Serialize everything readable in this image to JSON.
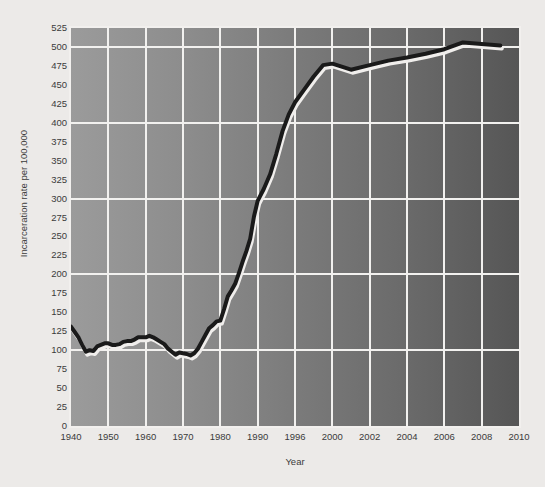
{
  "chart_data": {
    "type": "line",
    "title": "",
    "xlabel": "Year",
    "ylabel": "Incarceration rate per 100,000",
    "xlim": [
      1940,
      2010
    ],
    "ylim": [
      0,
      525
    ],
    "grid": true,
    "legend": null,
    "line_color": "#1a1a1a",
    "plot_bg_left": "#9b9b9b",
    "plot_bg_right": "#565656",
    "gridline_color": "#f2f1ef",
    "figure_bg": "#eceae8",
    "y_ticks": [
      0,
      25,
      50,
      75,
      100,
      125,
      150,
      175,
      200,
      225,
      250,
      275,
      300,
      325,
      350,
      375,
      400,
      425,
      450,
      475,
      500,
      525
    ],
    "y_gridlines": [
      100,
      200,
      300,
      400,
      500
    ],
    "x_ticks": [
      1940,
      1950,
      1960,
      1970,
      1980,
      1990,
      1996,
      2000,
      2002,
      2004,
      2006,
      2008,
      2010
    ],
    "x_tick_labels": [
      "1940",
      "1950",
      "1960",
      "1970",
      "1980",
      "1990",
      "1996",
      "2000",
      "2002",
      "2004",
      "2006",
      "2008",
      "2010"
    ],
    "x_axis_scale_note": "piecewise: 1940-1990 decadal spacing, 1990-1996 one interval, then 2-year intervals",
    "series": [
      {
        "name": "Incarceration rate per 100,000",
        "x": [
          1940,
          1941,
          1942,
          1943,
          1944,
          1945,
          1946,
          1947,
          1948,
          1949,
          1950,
          1951,
          1952,
          1953,
          1954,
          1955,
          1956,
          1957,
          1958,
          1959,
          1960,
          1961,
          1962,
          1963,
          1964,
          1965,
          1966,
          1967,
          1968,
          1969,
          1970,
          1971,
          1972,
          1973,
          1974,
          1975,
          1976,
          1977,
          1978,
          1979,
          1980,
          1981,
          1982,
          1983,
          1984,
          1985,
          1986,
          1987,
          1988,
          1989,
          1990,
          1991,
          1992,
          1993,
          1994,
          1995,
          1996,
          1997,
          1998,
          1999,
          2000,
          2001,
          2002,
          2003,
          2004,
          2005,
          2006,
          2007,
          2008,
          2009
        ],
        "y": [
          131,
          124,
          117,
          107,
          98,
          100,
          99,
          105,
          107,
          109,
          109,
          107,
          107,
          108,
          111,
          112,
          112,
          114,
          117,
          117,
          117,
          119,
          117,
          114,
          111,
          108,
          102,
          98,
          94,
          97,
          96,
          95,
          93,
          96,
          102,
          111,
          120,
          129,
          133,
          138,
          139,
          154,
          171,
          179,
          188,
          202,
          217,
          231,
          247,
          276,
          297,
          313,
          332,
          359,
          389,
          411,
          427,
          444,
          461,
          476,
          478,
          470,
          476,
          482,
          486,
          491,
          497,
          506,
          504,
          502
        ],
        "color": "#1a1a1a",
        "linewidth": 4,
        "has_highlight_shadow": true
      }
    ]
  }
}
